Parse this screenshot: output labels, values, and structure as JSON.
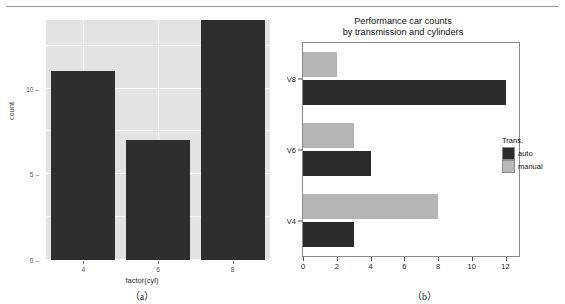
{
  "figure": {
    "panel_a": {
      "caption": "（a）",
      "chart_data": {
        "type": "bar",
        "title": "",
        "xlabel": "factor(cyl)",
        "ylabel": "count",
        "categories": [
          "4",
          "6",
          "8"
        ],
        "values": [
          11,
          7,
          14
        ],
        "ylim": [
          0,
          14
        ],
        "yticks": [
          0,
          5,
          10
        ],
        "ytick_labels": [
          "0",
          "5",
          "10"
        ],
        "xtick_labels": [
          "4",
          "6",
          "8"
        ],
        "grid": true,
        "legend": "none",
        "bar_color": "#2e2e2e",
        "panel_color": "#e3e3e3",
        "gridline_color": "#ffffff"
      }
    },
    "panel_b": {
      "caption": "（b）",
      "chart_data": {
        "type": "bar",
        "orientation": "horizontal",
        "title": "Performance car counts",
        "subtitle": "by transmission and cylinders",
        "xlabel": "",
        "ylabel": "",
        "categories": [
          "V4",
          "V6",
          "V8"
        ],
        "series": [
          {
            "name": "auto",
            "values": [
              3,
              4,
              12
            ],
            "color": "#2b2b2b"
          },
          {
            "name": "manual",
            "values": [
              8,
              3,
              2
            ],
            "color": "#b4b4b4"
          }
        ],
        "xlim": [
          0,
          12.8
        ],
        "xticks": [
          0,
          2,
          4,
          6,
          8,
          10,
          12
        ],
        "xtick_labels": [
          "0",
          "2",
          "4",
          "6",
          "8",
          "10",
          "12"
        ],
        "ytick_labels": [
          "V8",
          "V6",
          "V4"
        ],
        "grid": false,
        "legend": {
          "title": "Trans.",
          "position": "right",
          "entries": [
            "auto",
            "manual"
          ]
        }
      }
    }
  }
}
